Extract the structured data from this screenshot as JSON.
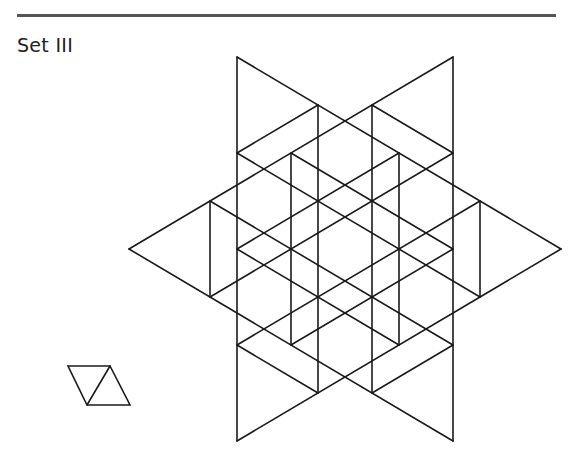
{
  "header": {
    "label": "Set III"
  },
  "figure": {
    "stroke_color": "#1a1a1a",
    "lattice": {
      "origin_x": 345,
      "origin_y": 249,
      "step_x": 54,
      "step_y": 32
    },
    "big_triangles": [
      {
        "name": "left-pointing",
        "vertices": [
          [
            -4,
            0
          ],
          [
            2,
            -6
          ],
          [
            2,
            6
          ]
        ],
        "subdivisions": 4
      },
      {
        "name": "right-pointing",
        "vertices": [
          [
            4,
            0
          ],
          [
            -2,
            -6
          ],
          [
            -2,
            6
          ]
        ],
        "subdivisions": 4
      }
    ]
  },
  "piece": {
    "description": "Rhombus made of two small triangles",
    "points": [
      [
        68,
        366
      ],
      [
        110,
        366
      ],
      [
        130,
        405
      ],
      [
        87,
        405
      ]
    ],
    "diagonal": [
      [
        110,
        366
      ],
      [
        87,
        405
      ]
    ]
  }
}
